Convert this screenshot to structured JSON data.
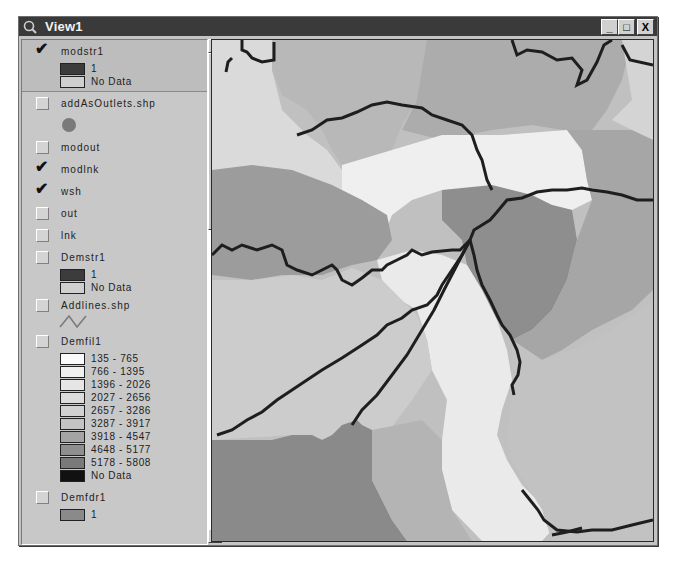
{
  "window": {
    "title": "View1",
    "buttons": {
      "minimize": "_",
      "maximize": "□",
      "close": "X"
    }
  },
  "toc": {
    "layers": [
      {
        "name": "modstr1",
        "checked": true,
        "selected": true,
        "legend": [
          {
            "label": "1",
            "color": "#3c3c3c"
          },
          {
            "label": "No Data",
            "color": "#cfcfcf"
          }
        ]
      },
      {
        "name": "addAsOutlets.shp",
        "checked": false,
        "symbol": "point",
        "symbol_color": "#7a7a7a"
      },
      {
        "name": "modout",
        "checked": false
      },
      {
        "name": "modlnk",
        "checked": true
      },
      {
        "name": "wsh",
        "checked": true
      },
      {
        "name": "out",
        "checked": false
      },
      {
        "name": "lnk",
        "checked": false
      },
      {
        "name": "Demstr1",
        "checked": false,
        "legend": [
          {
            "label": "1",
            "color": "#3c3c3c"
          },
          {
            "label": "No Data",
            "color": "#cfcfcf"
          }
        ]
      },
      {
        "name": "Addlines.shp",
        "checked": false,
        "symbol": "line",
        "symbol_color": "#7a7a7a"
      },
      {
        "name": "Demfil1",
        "checked": false,
        "legend": [
          {
            "label": "135 - 765",
            "color": "#fafafa"
          },
          {
            "label": "766 - 1395",
            "color": "#f0f0f0"
          },
          {
            "label": "1396 - 2026",
            "color": "#e6e6e6"
          },
          {
            "label": "2027 - 2656",
            "color": "#dcdcdc"
          },
          {
            "label": "2657 - 3286",
            "color": "#d2d2d2"
          },
          {
            "label": "3287 - 3917",
            "color": "#c4c4c4"
          },
          {
            "label": "3918 - 4547",
            "color": "#a4a4a4"
          },
          {
            "label": "4648 - 5177",
            "color": "#8e8e8e"
          },
          {
            "label": "5178 - 5808",
            "color": "#7a7a7a"
          },
          {
            "label": "No Data",
            "color": "#111111"
          }
        ]
      },
      {
        "name": "Demfdr1",
        "checked": false,
        "legend": [
          {
            "label": "1",
            "color": "#8a8a8a"
          }
        ]
      }
    ]
  },
  "scrollbar": {
    "up": "▲",
    "down": "▼"
  },
  "map": {
    "colors": {
      "lightest": "#efefef",
      "light": "#dcdcdc",
      "mid_light": "#c6c6c6",
      "mid": "#b0b0b0",
      "mid_dark": "#9a9a9a",
      "dark": "#8a8a8a",
      "stream": "#1e1e1e"
    }
  }
}
